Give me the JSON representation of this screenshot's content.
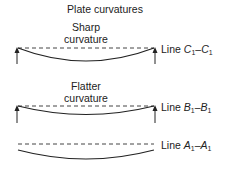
{
  "title": "Plate curvatures",
  "panels": [
    {
      "id": "C",
      "caption_line1": "Sharp",
      "caption_line2": "curvature",
      "line_prefix": "Line ",
      "line_var": "C",
      "line_sub": "1",
      "line_sep": "–",
      "line_var2": "C",
      "line_sub2": "1",
      "has_supports": true
    },
    {
      "id": "B",
      "caption_line1": "Flatter",
      "caption_line2": "curvature",
      "line_prefix": "Line ",
      "line_var": "B",
      "line_sub": "1",
      "line_sep": "–",
      "line_var2": "B",
      "line_sub2": "1",
      "has_supports": true
    },
    {
      "id": "A",
      "caption_line1": "",
      "caption_line2": "",
      "line_prefix": "Line ",
      "line_var": "A",
      "line_sub": "1",
      "line_sep": "–",
      "line_var2": "A",
      "line_sub2": "1",
      "has_supports": false
    }
  ],
  "colors": {
    "stroke": "#222222",
    "dash": "#444444"
  }
}
